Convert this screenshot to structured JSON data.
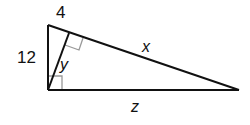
{
  "diagram": {
    "type": "right-triangle-with-altitude",
    "labels": {
      "top_segment": "4",
      "left_leg": "12",
      "altitude": "y",
      "hypotenuse_segment": "x",
      "bottom_leg": "z"
    },
    "colors": {
      "stroke": "#111111",
      "marker": "#999999",
      "background": "#ffffff"
    }
  }
}
